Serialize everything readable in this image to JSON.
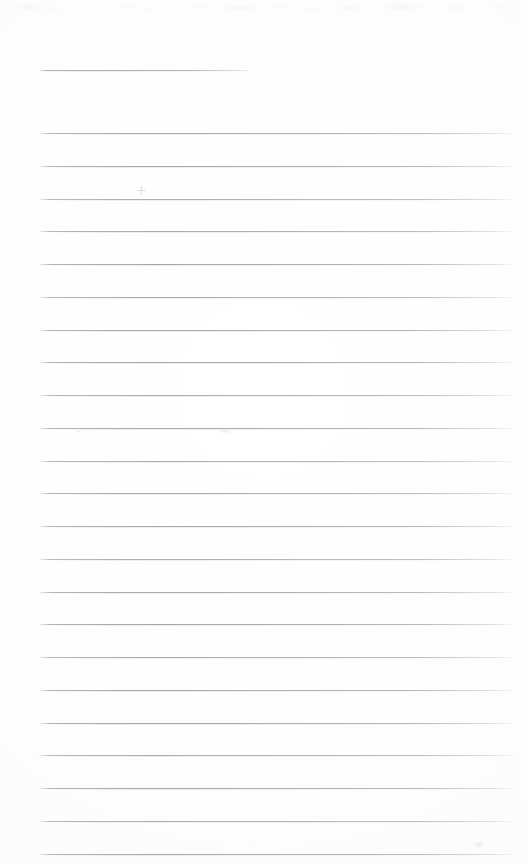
{
  "document": {
    "kind": "scanned-lined-paper",
    "title_text": "",
    "body_text": "",
    "written_content": "",
    "page_width": 527,
    "page_height": 864,
    "background_color": "#fdfdfd",
    "rule_color": "#a4a8b0",
    "rule_left_x": 39,
    "rule_right_x": 514,
    "title_rule_right_x": 253,
    "rule_spacing": 32.75,
    "first_rule_y": 70,
    "body_first_rule_y": 133,
    "rule_count_total": 25
  },
  "rules": [
    {
      "id": "title-rule",
      "y": 70,
      "x1": 39,
      "x2": 253,
      "variant": "title"
    },
    {
      "id": "rule-01",
      "y": 133,
      "x1": 39,
      "x2": 514,
      "variant": "body"
    },
    {
      "id": "rule-02",
      "y": 165.8,
      "x1": 39,
      "x2": 514,
      "variant": "body"
    },
    {
      "id": "rule-03",
      "y": 198.5,
      "x1": 39,
      "x2": 514,
      "variant": "body"
    },
    {
      "id": "rule-04",
      "y": 231.3,
      "x1": 39,
      "x2": 514,
      "variant": "body"
    },
    {
      "id": "rule-05",
      "y": 264.0,
      "x1": 39,
      "x2": 514,
      "variant": "body"
    },
    {
      "id": "rule-06",
      "y": 296.8,
      "x1": 39,
      "x2": 514,
      "variant": "body"
    },
    {
      "id": "rule-07",
      "y": 329.5,
      "x1": 39,
      "x2": 514,
      "variant": "body"
    },
    {
      "id": "rule-08",
      "y": 362.3,
      "x1": 39,
      "x2": 514,
      "variant": "body"
    },
    {
      "id": "rule-09",
      "y": 395.0,
      "x1": 39,
      "x2": 514,
      "variant": "body"
    },
    {
      "id": "rule-10",
      "y": 427.8,
      "x1": 39,
      "x2": 514,
      "variant": "body"
    },
    {
      "id": "rule-11",
      "y": 460.5,
      "x1": 39,
      "x2": 514,
      "variant": "body"
    },
    {
      "id": "rule-12",
      "y": 493.3,
      "x1": 39,
      "x2": 514,
      "variant": "body"
    },
    {
      "id": "rule-13",
      "y": 526.0,
      "x1": 39,
      "x2": 514,
      "variant": "body"
    },
    {
      "id": "rule-14",
      "y": 558.8,
      "x1": 39,
      "x2": 514,
      "variant": "body"
    },
    {
      "id": "rule-15",
      "y": 591.5,
      "x1": 39,
      "x2": 514,
      "variant": "body"
    },
    {
      "id": "rule-16",
      "y": 624.3,
      "x1": 39,
      "x2": 514,
      "variant": "body"
    },
    {
      "id": "rule-17",
      "y": 657.0,
      "x1": 39,
      "x2": 514,
      "variant": "body"
    },
    {
      "id": "rule-18",
      "y": 689.8,
      "x1": 39,
      "x2": 514,
      "variant": "body"
    },
    {
      "id": "rule-19",
      "y": 722.5,
      "x1": 39,
      "x2": 514,
      "variant": "body"
    },
    {
      "id": "rule-20",
      "y": 755.3,
      "x1": 39,
      "x2": 514,
      "variant": "body"
    },
    {
      "id": "rule-21",
      "y": 788.0,
      "x1": 39,
      "x2": 514,
      "variant": "body"
    },
    {
      "id": "rule-22",
      "y": 820.8,
      "x1": 39,
      "x2": 514,
      "variant": "body"
    },
    {
      "id": "rule-23",
      "y": 853.5,
      "x1": 39,
      "x2": 514,
      "variant": "body"
    }
  ],
  "marks": [
    {
      "id": "speck-cross",
      "x": 137,
      "y": 186,
      "label": "faint-cross-mark"
    },
    {
      "id": "speck-dot-left",
      "x": 76,
      "y": 430,
      "label": "faint-speck"
    },
    {
      "id": "speck-smudge-mid",
      "x": 218,
      "y": 428,
      "label": "faint-smudge"
    },
    {
      "id": "speck-dot-bottom-right",
      "x": 474,
      "y": 841,
      "label": "faint-speck"
    }
  ]
}
